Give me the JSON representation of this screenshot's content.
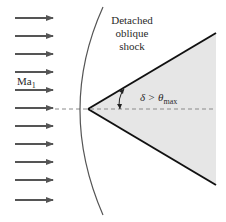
{
  "diagram": {
    "labels": {
      "shock_line1": "Detached",
      "shock_line2": "oblique",
      "shock_line3": "shock",
      "mach_symbol": "Ma",
      "mach_subscript": "1",
      "angle_text": "δ > θ",
      "angle_subscript": "max"
    },
    "flow_arrows": {
      "count": 11,
      "y_positions": [
        18,
        36,
        54,
        72,
        90,
        108,
        126,
        144,
        162,
        180,
        200
      ],
      "x_start": 15,
      "x_end": 53
    },
    "wedge": {
      "tip": [
        88,
        109
      ],
      "upper_end": [
        216,
        33
      ],
      "lower_end": [
        216,
        185
      ],
      "fill": "#e6e6e6",
      "stroke": "#111111"
    },
    "centerline": {
      "y": 109,
      "style": "dashed",
      "color": "#8a8a8a"
    },
    "shock_curve": {
      "start": [
        103,
        7
      ],
      "vertex": [
        70,
        109
      ],
      "end": [
        103,
        215
      ],
      "color": "#555555"
    },
    "colors": {
      "arrow": "#555555",
      "background": "#ffffff"
    }
  }
}
